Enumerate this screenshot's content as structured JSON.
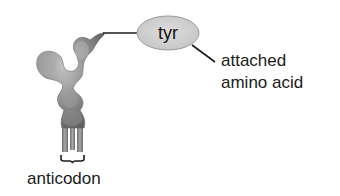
{
  "diagram": {
    "type": "tRNA structure illustration",
    "molecule": {
      "name": "tRNA",
      "fill_color": "#8c8c8c"
    },
    "amino_acid_node": {
      "label": "tyr",
      "fill_color": "#d2d2d2",
      "stroke_color": "#9a9a9a"
    },
    "labels": {
      "attached_amino_acid_line1": "attached",
      "attached_amino_acid_line2": "amino acid",
      "anticodon": "anticodon"
    },
    "connectors": [
      {
        "from": "tRNA acceptor end",
        "to": "tyr"
      },
      {
        "from": "tyr",
        "to": "attached amino acid label"
      }
    ]
  }
}
